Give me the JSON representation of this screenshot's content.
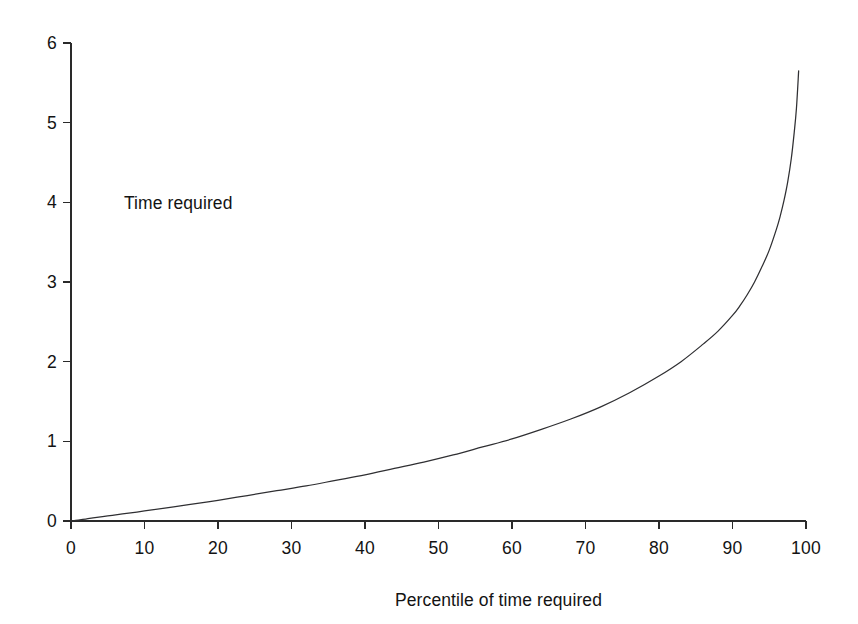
{
  "chart_data": {
    "type": "line",
    "title": "",
    "subtitle": "",
    "xlabel": "Percentile of time required",
    "ylabel": "",
    "series_annotation": "Time required",
    "xlim": [
      0,
      100
    ],
    "ylim": [
      0,
      6
    ],
    "x_ticks": [
      0,
      10,
      20,
      30,
      40,
      50,
      60,
      70,
      80,
      90,
      100
    ],
    "x_tick_labels": [
      "0",
      "10",
      "20",
      "30",
      "40",
      "50",
      "60",
      "70",
      "80",
      "90",
      "100"
    ],
    "y_ticks": [
      0,
      1,
      2,
      3,
      4,
      5,
      6
    ],
    "y_tick_labels": [
      "0",
      "1",
      "2",
      "3",
      "4",
      "5",
      "6"
    ],
    "grid": false,
    "legend_position": "none",
    "series": [
      {
        "name": "Time required",
        "color": "#2f2f32",
        "x": [
          0,
          1,
          2,
          3,
          5,
          7,
          10,
          13,
          16,
          20,
          24,
          28,
          32,
          36,
          40,
          44,
          48,
          52,
          56,
          60,
          64,
          68,
          72,
          76,
          80,
          83,
          86,
          88,
          90,
          91,
          92,
          93,
          94,
          95,
          96,
          96.5,
          97,
          97.5,
          98,
          98.4,
          98.7,
          99
        ],
        "values": [
          0,
          0.012,
          0.025,
          0.038,
          0.063,
          0.088,
          0.126,
          0.165,
          0.205,
          0.26,
          0.32,
          0.38,
          0.44,
          0.51,
          0.58,
          0.66,
          0.74,
          0.83,
          0.93,
          1.03,
          1.15,
          1.28,
          1.43,
          1.61,
          1.82,
          2.0,
          2.22,
          2.38,
          2.58,
          2.7,
          2.84,
          3.0,
          3.19,
          3.4,
          3.67,
          3.83,
          4.02,
          4.25,
          4.55,
          4.88,
          5.18,
          5.65
        ]
      }
    ]
  },
  "geometry": {
    "plot_left_px": 71,
    "plot_right_px": 806,
    "plot_baseline_px": 521,
    "plot_top_px": 43
  }
}
